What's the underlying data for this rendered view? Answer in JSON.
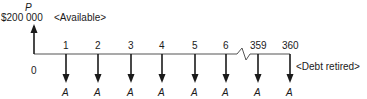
{
  "diagram": {
    "type": "cash-flow",
    "present_value": {
      "symbol": "P",
      "amount": "$200 000",
      "note": "<Available>"
    },
    "origin_label": "0",
    "periods": [
      {
        "label": "1",
        "flow": "A"
      },
      {
        "label": "2",
        "flow": "A"
      },
      {
        "label": "3",
        "flow": "A"
      },
      {
        "label": "4",
        "flow": "A"
      },
      {
        "label": "5",
        "flow": "A"
      },
      {
        "label": "6",
        "flow": "A"
      },
      {
        "label": "359",
        "flow": "A"
      },
      {
        "label": "360",
        "flow": "A"
      }
    ],
    "end_note": "<Debt retired>",
    "colors": {
      "ink": "#1a1a1a",
      "timeline": "#555555"
    }
  }
}
